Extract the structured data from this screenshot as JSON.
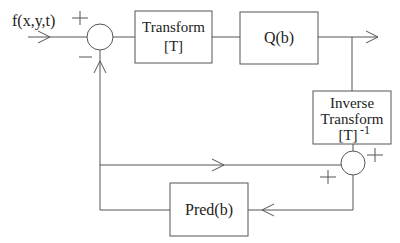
{
  "diagram": {
    "input_label": "f(x,y,t)",
    "blocks": {
      "transform": {
        "line1": "Transform",
        "line2": "[T]"
      },
      "quantizer": {
        "label": "Q(b)"
      },
      "inverse_transform": {
        "line1": "Inverse",
        "line2": "Transform",
        "line3": "[T]",
        "superscript": "-1"
      },
      "predictor": {
        "label": "Pred(b)"
      }
    },
    "summing_junctions": {
      "input_sum": {
        "plus_sign": "+",
        "minus_sign": "−"
      },
      "reconstruction_sum": {
        "plus_right": "+",
        "plus_left": "+"
      }
    },
    "colors": {
      "line": "#555555",
      "text": "#222222",
      "background": "#ffffff"
    }
  }
}
